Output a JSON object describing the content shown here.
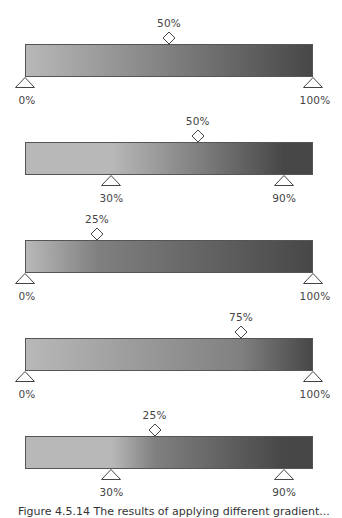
{
  "colors": {
    "light": "#b8b8b8",
    "dark": "#474747",
    "border": "#555555"
  },
  "chart_data": {
    "type": "diagram",
    "bars": [
      {
        "stops": [
          {
            "pos": 0,
            "label": "0%"
          },
          {
            "pos": 100,
            "label": "100%"
          }
        ],
        "midpoint": {
          "value": 50,
          "label": "50%",
          "abs_pos": 50
        }
      },
      {
        "stops": [
          {
            "pos": 30,
            "label": "30%"
          },
          {
            "pos": 90,
            "label": "90%"
          }
        ],
        "midpoint": {
          "value": 50,
          "label": "50%",
          "abs_pos": 60
        }
      },
      {
        "stops": [
          {
            "pos": 0,
            "label": "0%"
          },
          {
            "pos": 100,
            "label": "100%"
          }
        ],
        "midpoint": {
          "value": 25,
          "label": "25%",
          "abs_pos": 25
        }
      },
      {
        "stops": [
          {
            "pos": 0,
            "label": "0%"
          },
          {
            "pos": 100,
            "label": "100%"
          }
        ],
        "midpoint": {
          "value": 75,
          "label": "75%",
          "abs_pos": 75
        }
      },
      {
        "stops": [
          {
            "pos": 30,
            "label": "30%"
          },
          {
            "pos": 90,
            "label": "90%"
          }
        ],
        "midpoint": {
          "value": 25,
          "label": "25%",
          "abs_pos": 45
        }
      }
    ]
  },
  "rows": [
    {
      "mid_label": "50%",
      "stop_left": "0%",
      "stop_right": "100%"
    },
    {
      "mid_label": "50%",
      "stop_left": "30%",
      "stop_right": "90%"
    },
    {
      "mid_label": "25%",
      "stop_left": "0%",
      "stop_right": "100%"
    },
    {
      "mid_label": "75%",
      "stop_left": "0%",
      "stop_right": "100%"
    },
    {
      "mid_label": "25%",
      "stop_left": "30%",
      "stop_right": "90%"
    }
  ],
  "caption": "Figure 4.5.14 The results of applying different gradient..."
}
